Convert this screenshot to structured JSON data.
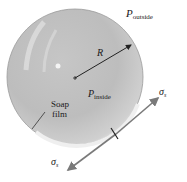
{
  "diagram": {
    "labels": {
      "p_outside": {
        "symbol": "P",
        "subscript": "outside"
      },
      "p_inside": {
        "symbol": "P",
        "subscript": "inside"
      },
      "radius": "R",
      "soap_film_line1": "Soap",
      "soap_film_line2": "film",
      "sigma_upper": {
        "symbol": "σ",
        "subscript": "s"
      },
      "sigma_lower": {
        "symbol": "σ",
        "subscript": "s"
      }
    },
    "colors": {
      "bubble_fill": "#c9c9c9",
      "bubble_rim": "#e6e6e6",
      "arrow": "#7a7a7a",
      "radius_arrow": "#222222",
      "text": "#1a1a1a"
    }
  }
}
